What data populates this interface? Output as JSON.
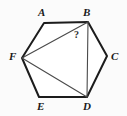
{
  "figure": {
    "type": "geometry-diagram",
    "shape_name": "hexagon",
    "canvas": {
      "width": 127,
      "height": 116
    },
    "background_color": "#fbfbfb",
    "stroke_color_outline": "#1c1c1c",
    "stroke_color_diagonal": "#4a4a4a",
    "outline_width": 2,
    "diagonal_width": 1,
    "vertices": [
      {
        "id": "A",
        "label": "A",
        "x": 44,
        "y": 23,
        "label_x": 38,
        "label_y": 7
      },
      {
        "id": "B",
        "label": "B",
        "x": 88,
        "y": 22,
        "label_x": 83,
        "label_y": 7
      },
      {
        "id": "C",
        "label": "C",
        "x": 107,
        "y": 56,
        "label_x": 111,
        "label_y": 52
      },
      {
        "id": "D",
        "label": "D",
        "x": 87,
        "y": 97,
        "label_x": 83,
        "label_y": 101
      },
      {
        "id": "E",
        "label": "E",
        "x": 39,
        "y": 97,
        "label_x": 37,
        "label_y": 101
      },
      {
        "id": "F",
        "label": "F",
        "x": 22,
        "y": 58,
        "label_x": 9,
        "label_y": 52
      }
    ],
    "outline_path": "A-B-C-D-E-F-A",
    "diagonals": [
      {
        "id": "FB",
        "from": "F",
        "to": "B"
      },
      {
        "id": "FD",
        "from": "F",
        "to": "D"
      },
      {
        "id": "BD",
        "from": "B",
        "to": "D"
      }
    ],
    "angle_markers": [
      {
        "id": "angle-FBD",
        "text": "?",
        "at_vertex": "B",
        "between": [
          "F",
          "D"
        ],
        "x": 74,
        "y": 30
      }
    ]
  }
}
